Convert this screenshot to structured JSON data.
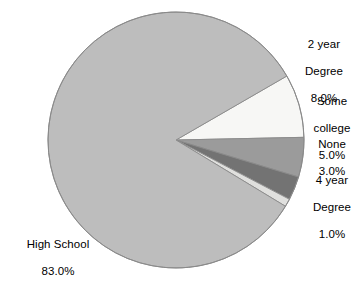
{
  "chart_data": {
    "type": "pie",
    "title": "",
    "subtitle": "",
    "xlabel": "",
    "ylabel": "",
    "legend_position": "none",
    "grid": false,
    "labels_show_percent": true,
    "categories": [
      "2 year Degree",
      "Some college",
      "None",
      "4 year Degree",
      "High School"
    ],
    "values": [
      8.0,
      5.0,
      3.0,
      1.0,
      83.0
    ],
    "value_labels": [
      "8.0%",
      "5.0%",
      "3.0%",
      "1.0%",
      "83.0%"
    ],
    "units": "percent",
    "total": 100.0,
    "start_angle_deg": 60,
    "direction": "clockwise",
    "slices": [
      {
        "name": "2 year Degree",
        "label_lines": [
          "2 year",
          "Degree",
          "8.0%"
        ],
        "value": 8.0,
        "value_label": "8.0%",
        "color": "#f7f7f5"
      },
      {
        "name": "Some college",
        "label_lines": [
          "Some",
          "college",
          "5.0%"
        ],
        "value": 5.0,
        "value_label": "5.0%",
        "color": "#9b9b9b"
      },
      {
        "name": "None",
        "label_lines": [
          "None",
          "3.0%"
        ],
        "value": 3.0,
        "value_label": "3.0%",
        "color": "#737373"
      },
      {
        "name": "4 year Degree",
        "label_lines": [
          "4 year",
          "Degree",
          "1.0%"
        ],
        "value": 1.0,
        "value_label": "1.0%",
        "color": "#e0e0de"
      },
      {
        "name": "High School",
        "label_lines": [
          "High School",
          "83.0%"
        ],
        "value": 83.0,
        "value_label": "83.0%",
        "color": "#bdbdbd"
      }
    ]
  },
  "labels": {
    "two_year": "2 year\nDegree\n8.0%",
    "some_college": "Some\ncollege\n5.0%",
    "none": "None\n3.0%",
    "four_year": "4 year\nDegree\n1.0%",
    "high_school": "High School\n83.0%"
  },
  "style": {
    "background": "#ffffff",
    "outline": "#8a8a8a",
    "text_color": "#000000"
  }
}
